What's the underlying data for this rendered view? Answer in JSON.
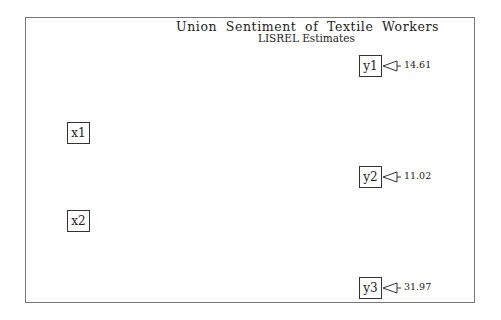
{
  "diagram": {
    "title": "Union Sentiment of Textile Workers",
    "subtitle": "LISREL Estimates",
    "exogenous": [
      {
        "id": "x1",
        "label": "x1"
      },
      {
        "id": "x2",
        "label": "x2"
      }
    ],
    "endogenous": [
      {
        "id": "y1",
        "label": "y1",
        "error_variance": "14.61"
      },
      {
        "id": "y2",
        "label": "y2",
        "error_variance": "11.02"
      },
      {
        "id": "y3",
        "label": "y3",
        "error_variance": "31.97"
      }
    ],
    "colors": {
      "line": "#333333",
      "frame": "#777777",
      "background": "#ffffff"
    }
  }
}
